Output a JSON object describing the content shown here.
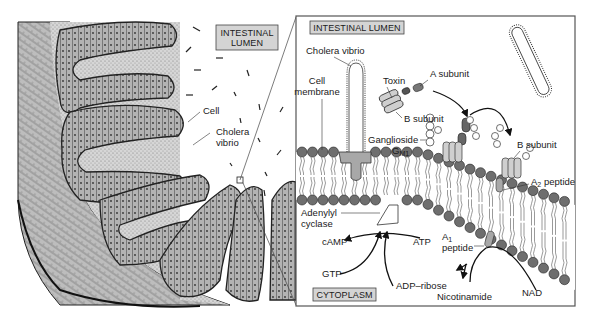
{
  "figure": {
    "colors": {
      "tissue_fill": "#cfcfcf",
      "tissue_dark": "#9a9a9a",
      "cell_fill": "#a8a8a8",
      "outline": "#2a2a2a",
      "label_box_fill": "#d4d4d4",
      "lipid_head": "#6e6e6e",
      "protein_fill": "#bdbdbd",
      "panel_border": "#555555",
      "background": "#ffffff"
    }
  },
  "overview": {
    "lumen_label_line1": "INTESTINAL",
    "lumen_label_line2": "LUMEN",
    "cell_label": "Cell",
    "vibrio_label_line1": "Cholera",
    "vibrio_label_line2": "vibrio"
  },
  "detail_panel": {
    "lumen_label": "INTESTINAL LUMEN",
    "cytoplasm_label": "CYTOPLASM",
    "labels": {
      "cholera_vibrio": "Cholera vibrio",
      "cell_membrane_line1": "Cell",
      "cell_membrane_line2": "membrane",
      "toxin": "Toxin",
      "a_subunit": "A subunit",
      "b_subunit_left": "B subunit",
      "ganglioside": "Ganglioside",
      "gm1_g": "G",
      "gm1_sub": "M1",
      "b_subunit_right": "B subunit",
      "a2_a": "A",
      "a2_sub": "2",
      "a2_rest": " peptide",
      "adenylyl_line1": "Adenylyl",
      "adenylyl_line2": "cyclase",
      "camp": "cAMP",
      "atp": "ATP",
      "a1_a": "A",
      "a1_sub": "1",
      "a1_line2": "peptide",
      "gtp": "GTP",
      "adp_ribose": "ADP–ribose",
      "nicotinamide": "Nicotinamide",
      "nad": "NAD"
    }
  }
}
